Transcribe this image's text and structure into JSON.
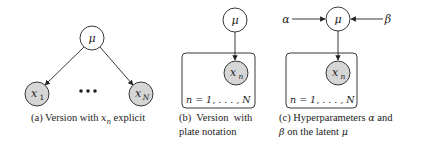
{
  "colors": {
    "stroke": "#222222",
    "observed_fill": "#d6d6d6",
    "latent_fill": "#ffffff",
    "text": "#222222"
  },
  "panels": [
    {
      "id": "a",
      "nodes": [
        {
          "name": "mu",
          "label": "μ",
          "observed": false
        },
        {
          "name": "x1",
          "label": "x",
          "subscript": "1",
          "observed": true
        },
        {
          "name": "xN",
          "label": "x",
          "subscript": "N",
          "observed": true
        }
      ],
      "ellipsis": "•••",
      "caption": {
        "prefix": "(a) Version with ",
        "math": "x",
        "math_sub": "n",
        "suffix": " explicit"
      }
    },
    {
      "id": "b",
      "nodes": [
        {
          "name": "mu",
          "label": "μ",
          "observed": false
        },
        {
          "name": "xn",
          "label": "x",
          "subscript": "n",
          "observed": true
        }
      ],
      "plate_label": "n = 1, . . . , N",
      "caption": {
        "line1": "(b)  Version  with",
        "line2": "plate notation"
      }
    },
    {
      "id": "c",
      "nodes": [
        {
          "name": "alpha",
          "label": "α"
        },
        {
          "name": "mu",
          "label": "μ",
          "observed": false
        },
        {
          "name": "beta",
          "label": "β"
        },
        {
          "name": "xn",
          "label": "x",
          "subscript": "n",
          "observed": true
        }
      ],
      "plate_label": "n = 1, . . . , N",
      "caption": {
        "line1_prefix": "(c) Hyperparameters ",
        "line1_math": "α",
        "line1_suffix": " and",
        "line2_math": "β",
        "line2_mid": " on the latent ",
        "line2_math2": "μ"
      }
    }
  ]
}
